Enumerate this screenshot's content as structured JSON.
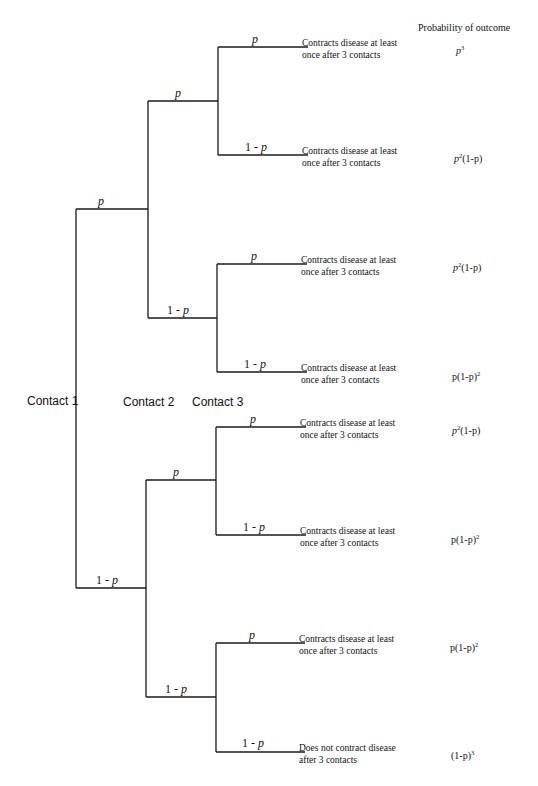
{
  "header": {
    "probability_column": "Probability of outcome"
  },
  "contacts": [
    "Contact 1",
    "Contact 2",
    "Contact 3"
  ],
  "branch_labels": {
    "p": "p",
    "one_minus_p_prefix": "1 - ",
    "one_minus_p_var": "p"
  },
  "outcomes": [
    {
      "line1": "Contracts disease at least",
      "line2": "once after 3 contacts",
      "prob_base": "p",
      "prob_sup": "3",
      "prob_tail": ""
    },
    {
      "line1": "Contracts disease at least",
      "line2": "once after 3 contacts",
      "prob_base": "p",
      "prob_sup": "2",
      "prob_tail": "(1-p)"
    },
    {
      "line1": "Contracts disease at least",
      "line2": "once after 3 contacts",
      "prob_base": "p",
      "prob_sup": "2",
      "prob_tail": "(1-p)"
    },
    {
      "line1": "Contracts disease at least",
      "line2": "once after 3 contacts",
      "prob_base": "p(1-p)",
      "prob_sup": "2",
      "prob_tail": ""
    },
    {
      "line1": "Contracts disease at least",
      "line2": "once after 3 contacts",
      "prob_base": "p",
      "prob_sup": "2",
      "prob_tail": "(1-p)"
    },
    {
      "line1": "Contracts disease at least",
      "line2": "once after 3 contacts",
      "prob_base": "p(1-p)",
      "prob_sup": "2",
      "prob_tail": ""
    },
    {
      "line1": "Contracts disease at least",
      "line2": "once after 3 contacts",
      "prob_base": "p(1-p)",
      "prob_sup": "2",
      "prob_tail": ""
    },
    {
      "line1": "Does not contract disease",
      "line2": "after 3 contacts",
      "prob_base": "(1-p)",
      "prob_sup": "3",
      "prob_tail": ""
    }
  ],
  "colors": {
    "line": "#1a1a1a",
    "text": "#111111",
    "background": "#ffffff"
  }
}
